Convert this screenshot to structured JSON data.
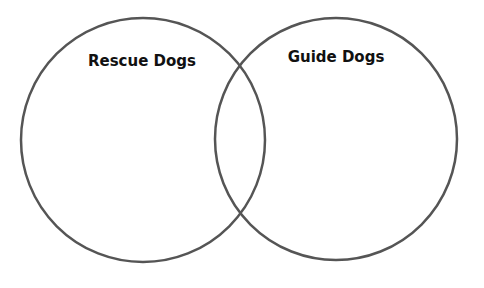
{
  "diagram": {
    "type": "venn",
    "stroke_color": "#555555",
    "sets": [
      {
        "label": "Rescue Dogs",
        "cx": 143,
        "cy": 140,
        "r": 122,
        "label_x": 142,
        "label_y": 66
      },
      {
        "label": "Guide Dogs",
        "cx": 336,
        "cy": 139,
        "r": 121,
        "label_x": 336,
        "label_y": 62
      }
    ],
    "intersection_label": ""
  }
}
